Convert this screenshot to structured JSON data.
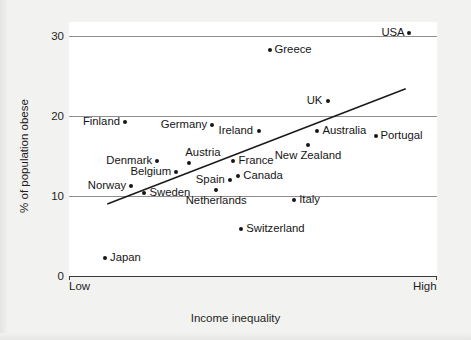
{
  "chart_data": {
    "type": "scatter",
    "title": "",
    "xlabel": "Income inequality",
    "ylabel": "% of population obese",
    "xtick_labels": [
      "Low",
      "High"
    ],
    "ytick_labels": [
      "0",
      "10",
      "20",
      "30"
    ],
    "ylim": [
      0,
      32
    ],
    "grid": "horizontal gridlines at 10, 20, 30",
    "legend": "none",
    "points": [
      {
        "label": "USA",
        "x": 0.925,
        "y": 30.4,
        "label_side": "left"
      },
      {
        "label": "Greece",
        "x": 0.545,
        "y": 28.3,
        "label_side": "right"
      },
      {
        "label": "UK",
        "x": 0.703,
        "y": 21.9,
        "label_side": "left"
      },
      {
        "label": "Finland",
        "x": 0.152,
        "y": 19.2,
        "label_side": "left"
      },
      {
        "label": "Germany",
        "x": 0.388,
        "y": 18.9,
        "label_side": "left"
      },
      {
        "label": "Ireland",
        "x": 0.515,
        "y": 18.1,
        "label_side": "left"
      },
      {
        "label": "Australia",
        "x": 0.675,
        "y": 18.1,
        "label_side": "right"
      },
      {
        "label": "Portugal",
        "x": 0.833,
        "y": 17.5,
        "label_side": "right"
      },
      {
        "label": "New Zealand",
        "x": 0.65,
        "y": 16.4,
        "label_side": "below"
      },
      {
        "label": "Denmark",
        "x": 0.24,
        "y": 14.4,
        "label_side": "left"
      },
      {
        "label": "Austria",
        "x": 0.327,
        "y": 14.1,
        "label_side": "above-left"
      },
      {
        "label": "France",
        "x": 0.447,
        "y": 14.4,
        "label_side": "right"
      },
      {
        "label": "Belgium",
        "x": 0.292,
        "y": 13.0,
        "label_side": "left"
      },
      {
        "label": "Canada",
        "x": 0.46,
        "y": 12.5,
        "label_side": "right"
      },
      {
        "label": "Spain",
        "x": 0.437,
        "y": 12.0,
        "label_side": "left"
      },
      {
        "label": "Norway",
        "x": 0.168,
        "y": 11.2,
        "label_side": "left"
      },
      {
        "label": "Sweden",
        "x": 0.205,
        "y": 10.4,
        "label_side": "right"
      },
      {
        "label": "Netherlands",
        "x": 0.4,
        "y": 10.8,
        "label_side": "below"
      },
      {
        "label": "Italy",
        "x": 0.612,
        "y": 9.5,
        "label_side": "right"
      },
      {
        "label": "Switzerland",
        "x": 0.468,
        "y": 5.9,
        "label_side": "right"
      },
      {
        "label": "Japan",
        "x": 0.098,
        "y": 2.3,
        "label_side": "right"
      }
    ],
    "trendline": {
      "x_start": 0.104,
      "y_start": 9.0,
      "x_end": 0.915,
      "y_end": 23.4,
      "color": "#1a1a1a"
    },
    "colors": {
      "point": "#161616",
      "gridline": "#8f8f8f",
      "axis": "#3a3a3a",
      "panel_background": "#ffffff",
      "figure_background": "#f2f2f0",
      "text": "#151515"
    }
  }
}
